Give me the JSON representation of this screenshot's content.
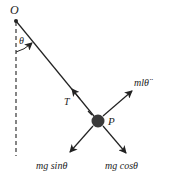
{
  "diagram": {
    "type": "pendulum-free-body",
    "labels": {
      "pivot": "O",
      "angle": "θ",
      "tension": "T",
      "bob": "P",
      "tangential_accel": "mlθ̈",
      "weight_tangential": "mg sinθ",
      "weight_radial": "mg cosθ"
    },
    "colors": {
      "line": "#222222",
      "bob": "#3a3a3a",
      "dashed": "#444444",
      "background": "#ffffff"
    }
  }
}
